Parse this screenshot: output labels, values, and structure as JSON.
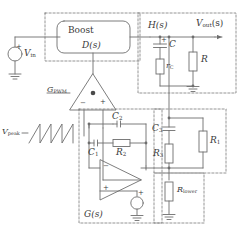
{
  "diagram": {
    "colors": {
      "wire": "#6e6e6e",
      "dashed_box": "#7a7a7a",
      "text": "#3a3a3a",
      "background": "#ffffff"
    },
    "blocks": {
      "boost": {
        "name": "Boost",
        "transfer": "D(s)"
      }
    },
    "nodes": {
      "h_of_s": "H(s)",
      "v_out": "V",
      "v_out_sub": "out",
      "v_out_tail": "(s)"
    },
    "sources": {
      "vin": {
        "label": "V",
        "sub": "in"
      },
      "vpeak": {
        "label": "V",
        "sub": "peak"
      }
    },
    "gains": {
      "pwm": {
        "label": "G",
        "sub": "PWM"
      },
      "compensator": "G(s)"
    },
    "components": [
      {
        "id": "C",
        "label": "C",
        "sub": "",
        "type": "capacitor",
        "polarity": "+"
      },
      {
        "id": "rC",
        "label": "r",
        "sub": "C",
        "type": "resistor"
      },
      {
        "id": "R",
        "label": "R",
        "sub": "",
        "type": "resistor"
      },
      {
        "id": "C1",
        "label": "C",
        "sub": "1",
        "type": "capacitor"
      },
      {
        "id": "C2",
        "label": "C",
        "sub": "2",
        "type": "capacitor"
      },
      {
        "id": "C3",
        "label": "C",
        "sub": "3",
        "type": "capacitor"
      },
      {
        "id": "R1",
        "label": "R",
        "sub": "1",
        "type": "resistor"
      },
      {
        "id": "R2",
        "label": "R",
        "sub": "2",
        "type": "resistor"
      },
      {
        "id": "R3",
        "label": "R",
        "sub": "3",
        "type": "resistor"
      },
      {
        "id": "Rlower",
        "label": "R",
        "sub": "lower",
        "type": "resistor"
      }
    ],
    "terminals": {
      "comparator_minus": "−",
      "comparator_plus": "+",
      "opamp_minus": "−",
      "opamp_plus": "+",
      "vin_plus": "+",
      "cap_plus": "+",
      "ref_plus": "+"
    }
  }
}
